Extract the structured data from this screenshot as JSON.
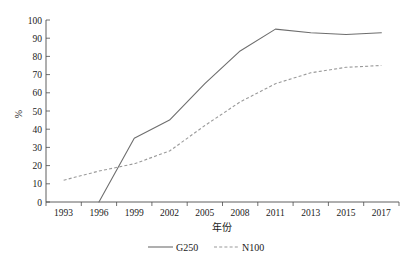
{
  "chart_data": {
    "type": "line",
    "title": "",
    "xlabel": "年份",
    "ylabel": "%",
    "ylim": [
      0,
      100
    ],
    "ytick_step": 10,
    "yticks": [
      0,
      10,
      20,
      30,
      40,
      50,
      60,
      70,
      80,
      90,
      100
    ],
    "grid": false,
    "legend_position": "bottom",
    "categories": [
      "1993",
      "1996",
      "1999",
      "2002",
      "2005",
      "2008",
      "2011",
      "2013",
      "2015",
      "2017"
    ],
    "series": [
      {
        "name": "G250",
        "style": "solid",
        "color": "#6e6e6e",
        "values": [
          null,
          0,
          35,
          45,
          65,
          83,
          95,
          93,
          92,
          93
        ]
      },
      {
        "name": "N100",
        "style": "dashed",
        "color": "#9a9a9a",
        "values": [
          12,
          17,
          21,
          28,
          42,
          55,
          65,
          71,
          74,
          75
        ]
      }
    ]
  },
  "axes": {
    "y_title": "%",
    "x_title": "年份",
    "y_tick_labels": [
      "100",
      "90",
      "80",
      "70",
      "60",
      "50",
      "40",
      "30",
      "20",
      "10",
      "0"
    ],
    "x_tick_labels": [
      "1993",
      "1996",
      "1999",
      "2002",
      "2005",
      "2008",
      "2011",
      "2013",
      "2015",
      "2017"
    ]
  },
  "legend": {
    "items": [
      {
        "label": "G250",
        "style": "solid",
        "color": "#6e6e6e"
      },
      {
        "label": "N100",
        "style": "dashed",
        "color": "#9a9a9a"
      }
    ]
  }
}
